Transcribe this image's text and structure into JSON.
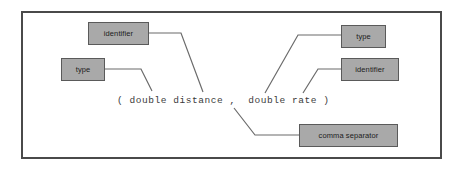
{
  "diagram": {
    "frame": {
      "border_color": "#4a4a4a"
    },
    "code": {
      "text": "( double distance ,  double rate )",
      "color": "#3b3b3b"
    },
    "box_style": {
      "fill": "#a9a9a9",
      "border": "#5a5a5a",
      "text_color": "#1c1c1c"
    },
    "connector_color": "#6b6b6b",
    "nodes": [
      {
        "id": "identifier-left",
        "label": "identifier"
      },
      {
        "id": "type-left",
        "label": "type"
      },
      {
        "id": "type-right",
        "label": "type"
      },
      {
        "id": "identifier-right",
        "label": "identifier"
      },
      {
        "id": "comma-separator",
        "label": "comma separator"
      }
    ]
  }
}
